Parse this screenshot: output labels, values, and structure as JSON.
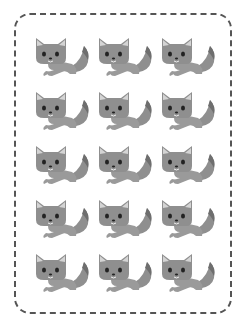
{
  "worksheet": {
    "item_label": "fox",
    "rows": 5,
    "columns": 3,
    "total_items": 15,
    "colors": {
      "border": "#555555",
      "fox_body": "#8f8f8f",
      "fox_light": "#b5b5b5",
      "fox_dark": "#6e6e6e",
      "eyes": "#222222",
      "background": "#ffffff"
    },
    "items": [
      {
        "label": "fox"
      },
      {
        "label": "fox"
      },
      {
        "label": "fox"
      },
      {
        "label": "fox"
      },
      {
        "label": "fox"
      },
      {
        "label": "fox"
      },
      {
        "label": "fox"
      },
      {
        "label": "fox"
      },
      {
        "label": "fox"
      },
      {
        "label": "fox"
      },
      {
        "label": "fox"
      },
      {
        "label": "fox"
      },
      {
        "label": "fox"
      },
      {
        "label": "fox"
      },
      {
        "label": "fox"
      }
    ]
  }
}
